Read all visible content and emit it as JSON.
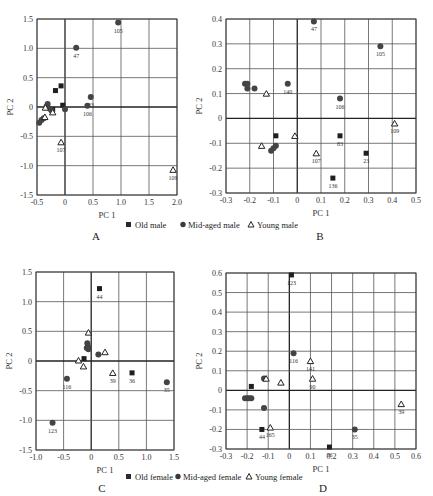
{
  "legend_male": {
    "old": "Old male",
    "mid": "Mid-aged male",
    "young": "Young male"
  },
  "legend_female": {
    "old": "Old female",
    "mid": "Mid-aged female",
    "young": "Young female"
  },
  "colors": {
    "marker": "#3a3a3a",
    "grid": "#555555",
    "axis": "#222222"
  },
  "chart_data": [
    {
      "panel": "A",
      "type": "scatter",
      "xlabel": "PC 1",
      "ylabel": "PC 2",
      "xlim": [
        -0.5,
        2.0
      ],
      "ylim": [
        -1.5,
        1.5
      ],
      "xticks": [
        "-0.5",
        "0",
        "0.5",
        "1.0",
        "1.5",
        "2.0"
      ],
      "yticks": [
        "1.5",
        "1.0",
        "0.5",
        "0",
        "-0.5",
        "-1.0",
        "-1.5"
      ],
      "grid": true,
      "frame": {
        "x0": 37,
        "x1": 177,
        "y0": 19,
        "y1": 195
      },
      "series": [
        {
          "name": "Old male",
          "marker": "square",
          "points": [
            {
              "x": -0.17,
              "y": 0.28
            },
            {
              "x": -0.07,
              "y": 0.36
            },
            {
              "x": -0.04,
              "y": 0.03
            },
            {
              "x": -0.22,
              "y": -0.04
            }
          ]
        },
        {
          "name": "Mid-aged male",
          "marker": "circle",
          "points": [
            {
              "x": 0.2,
              "y": 1.01,
              "label": "47"
            },
            {
              "x": 0.95,
              "y": 1.44,
              "label": "105"
            },
            {
              "x": 0.46,
              "y": 0.17,
              "label": "23"
            },
            {
              "x": 0.4,
              "y": 0.02,
              "label": "106"
            },
            {
              "x": 0.0,
              "y": -0.04
            },
            {
              "x": -0.31,
              "y": 0.05
            },
            {
              "x": -0.33,
              "y": 0.01
            },
            {
              "x": -0.27,
              "y": -0.03
            },
            {
              "x": -0.24,
              "y": -0.06
            },
            {
              "x": -0.46,
              "y": -0.27
            },
            {
              "x": -0.42,
              "y": -0.22
            },
            {
              "x": -0.38,
              "y": -0.19
            }
          ]
        },
        {
          "name": "Young male",
          "marker": "triangle",
          "points": [
            {
              "x": -0.07,
              "y": -0.6,
              "label": "107"
            },
            {
              "x": 1.93,
              "y": -1.07,
              "label": "109"
            },
            {
              "x": -0.22,
              "y": -0.09
            },
            {
              "x": -0.35,
              "y": -0.01
            },
            {
              "x": -0.36,
              "y": -0.17
            }
          ]
        }
      ]
    },
    {
      "panel": "B",
      "type": "scatter",
      "xlabel": "PC 1",
      "ylabel": "PC 2",
      "xlim": [
        -0.3,
        0.5
      ],
      "ylim": [
        -0.3,
        0.4
      ],
      "xticks": [
        "-0.3",
        "-0.2",
        "-0.1",
        "0",
        "0.1",
        "0.2",
        "0.3",
        "0.4",
        "0.5"
      ],
      "yticks": [
        "0.4",
        "0.3",
        "0.2",
        "0.1",
        "0",
        "-0.1",
        "-0.2",
        "-0.3"
      ],
      "grid": true,
      "frame": {
        "x0": 226,
        "x1": 416,
        "y0": 19,
        "y1": 193
      },
      "series": [
        {
          "name": "Old male",
          "marker": "square",
          "points": [
            {
              "x": -0.09,
              "y": -0.07
            },
            {
              "x": 0.18,
              "y": -0.07,
              "label": "83"
            },
            {
              "x": 0.15,
              "y": -0.24,
              "label": "136"
            },
            {
              "x": 0.29,
              "y": -0.14,
              "label": "23"
            }
          ]
        },
        {
          "name": "Mid-aged male",
          "marker": "circle",
          "points": [
            {
              "x": 0.07,
              "y": 0.39,
              "label": "47"
            },
            {
              "x": 0.35,
              "y": 0.29,
              "label": "105"
            },
            {
              "x": -0.04,
              "y": 0.14,
              "label": "140"
            },
            {
              "x": 0.18,
              "y": 0.08,
              "label": "106"
            },
            {
              "x": -0.22,
              "y": 0.14
            },
            {
              "x": -0.21,
              "y": 0.14
            },
            {
              "x": -0.21,
              "y": 0.12
            },
            {
              "x": -0.18,
              "y": 0.12
            },
            {
              "x": -0.09,
              "y": -0.11
            },
            {
              "x": -0.1,
              "y": -0.12
            },
            {
              "x": -0.11,
              "y": -0.13
            }
          ]
        },
        {
          "name": "Young male",
          "marker": "triangle",
          "points": [
            {
              "x": -0.13,
              "y": 0.1
            },
            {
              "x": -0.15,
              "y": -0.11
            },
            {
              "x": -0.01,
              "y": -0.07
            },
            {
              "x": 0.08,
              "y": -0.14,
              "label": "107"
            },
            {
              "x": 0.41,
              "y": -0.02,
              "label": "109"
            }
          ]
        }
      ]
    },
    {
      "panel": "C",
      "type": "scatter",
      "xlabel": "PC 1",
      "ylabel": "PC 2",
      "xlim": [
        -1.0,
        1.5
      ],
      "ylim": [
        -1.5,
        1.5
      ],
      "xticks": [
        "-1.0",
        "-0.5",
        "0",
        "0.5",
        "1.0",
        "1.5"
      ],
      "yticks": [
        "1.5",
        "1.0",
        "0.5",
        "0",
        "-0.5",
        "-1.0",
        "-1.5"
      ],
      "grid": true,
      "frame": {
        "x0": 36,
        "x1": 174,
        "y0": 272,
        "y1": 450
      },
      "series": [
        {
          "name": "Old female",
          "marker": "square",
          "points": [
            {
              "x": 0.15,
              "y": 1.22,
              "label": "44"
            },
            {
              "x": -0.13,
              "y": 0.04
            },
            {
              "x": 0.74,
              "y": -0.2,
              "label": "36"
            }
          ]
        },
        {
          "name": "Mid-aged female",
          "marker": "circle",
          "points": [
            {
              "x": -0.44,
              "y": -0.3,
              "label": "116"
            },
            {
              "x": -0.7,
              "y": -1.04,
              "label": "123"
            },
            {
              "x": 1.37,
              "y": -0.36,
              "label": "35"
            },
            {
              "x": 0.13,
              "y": 0.11
            },
            {
              "x": -0.07,
              "y": 0.3
            },
            {
              "x": -0.06,
              "y": 0.25
            },
            {
              "x": -0.05,
              "y": 0.2
            },
            {
              "x": -0.08,
              "y": 0.22
            }
          ]
        },
        {
          "name": "Young female",
          "marker": "triangle",
          "points": [
            {
              "x": -0.05,
              "y": 0.48
            },
            {
              "x": 0.25,
              "y": 0.15
            },
            {
              "x": -0.23,
              "y": 0.01
            },
            {
              "x": -0.14,
              "y": -0.09
            },
            {
              "x": 0.39,
              "y": -0.2,
              "label": "39"
            }
          ]
        }
      ]
    },
    {
      "panel": "D",
      "type": "scatter",
      "xlabel": "PC 1",
      "ylabel": "PC 2",
      "xlim": [
        -0.3,
        0.6
      ],
      "ylim": [
        -0.3,
        0.6
      ],
      "xticks": [
        "-0.3",
        "-0.2",
        "-0.1",
        "0",
        "0.1",
        "0.2",
        "0.3",
        "0.4",
        "0.5",
        "0.6"
      ],
      "yticks": [
        "0.6",
        "0.5",
        "0.4",
        "0.3",
        "0.2",
        "0.1",
        "0",
        "-0.1",
        "-0.2",
        "-0.3"
      ],
      "grid": true,
      "frame": {
        "x0": 226,
        "x1": 416,
        "y0": 273,
        "y1": 449
      },
      "series": [
        {
          "name": "Old female",
          "marker": "square",
          "points": [
            {
              "x": 0.01,
              "y": 0.59,
              "label": "123"
            },
            {
              "x": -0.18,
              "y": 0.02
            },
            {
              "x": -0.13,
              "y": -0.2,
              "label": "44"
            },
            {
              "x": 0.19,
              "y": -0.29,
              "label": "36"
            }
          ]
        },
        {
          "name": "Mid-aged female",
          "marker": "circle",
          "points": [
            {
              "x": 0.02,
              "y": 0.19,
              "label": "116"
            },
            {
              "x": 0.31,
              "y": -0.2,
              "label": "35"
            },
            {
              "x": -0.21,
              "y": -0.04
            },
            {
              "x": -0.2,
              "y": -0.04
            },
            {
              "x": -0.19,
              "y": -0.04
            },
            {
              "x": -0.18,
              "y": -0.04
            },
            {
              "x": -0.12,
              "y": -0.09
            },
            {
              "x": -0.12,
              "y": 0.06
            }
          ]
        },
        {
          "name": "Young female",
          "marker": "triangle",
          "points": [
            {
              "x": 0.1,
              "y": 0.15,
              "label": "141"
            },
            {
              "x": 0.11,
              "y": 0.06,
              "label": "90"
            },
            {
              "x": -0.04,
              "y": 0.04
            },
            {
              "x": -0.11,
              "y": 0.06
            },
            {
              "x": -0.09,
              "y": -0.19,
              "label": "165"
            },
            {
              "x": 0.53,
              "y": -0.07,
              "label": "39"
            }
          ]
        }
      ]
    }
  ],
  "panel_letters": [
    "A",
    "B",
    "C",
    "D"
  ]
}
